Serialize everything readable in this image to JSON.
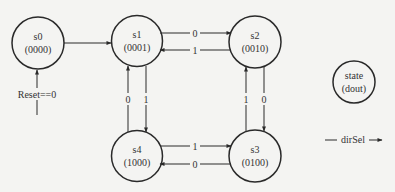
{
  "diagram": {
    "type": "state-machine",
    "colors": {
      "background": "#f4f4f2",
      "stroke": "#2a2a2a",
      "text": "#333333"
    },
    "states": [
      {
        "id": "s0",
        "name": "s0",
        "output": "(0000)"
      },
      {
        "id": "s1",
        "name": "s1",
        "output": "(0001)"
      },
      {
        "id": "s2",
        "name": "s2",
        "output": "(0010)"
      },
      {
        "id": "s3",
        "name": "s3",
        "output": "(0100)"
      },
      {
        "id": "s4",
        "name": "s4",
        "output": "(1000)"
      }
    ],
    "transitions": [
      {
        "from": "s0",
        "to": "s1",
        "label": ""
      },
      {
        "from": "s1",
        "to": "s2",
        "label": "0"
      },
      {
        "from": "s2",
        "to": "s1",
        "label": "1"
      },
      {
        "from": "s2",
        "to": "s3",
        "label": "0"
      },
      {
        "from": "s3",
        "to": "s2",
        "label": "1"
      },
      {
        "from": "s3",
        "to": "s4",
        "label": "0"
      },
      {
        "from": "s4",
        "to": "s3",
        "label": "1"
      },
      {
        "from": "s4",
        "to": "s1",
        "label": "0"
      },
      {
        "from": "s1",
        "to": "s4",
        "label": "1"
      }
    ],
    "reset": {
      "label": "Reset==0",
      "target": "s0"
    },
    "legend": {
      "state_name": "state",
      "state_output": "(dout)",
      "input_label": "dirSel"
    }
  }
}
